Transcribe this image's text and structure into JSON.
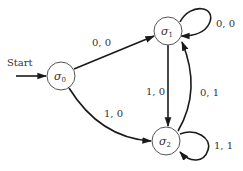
{
  "diagram": {
    "type": "finite-state-machine",
    "start_label": "Start",
    "states": [
      {
        "id": "s0",
        "symbol": "σ",
        "subscript": "0"
      },
      {
        "id": "s1",
        "symbol": "σ",
        "subscript": "1"
      },
      {
        "id": "s2",
        "symbol": "σ",
        "subscript": "2"
      }
    ],
    "start_state": "s0",
    "transitions": [
      {
        "from": "s0",
        "to": "s1",
        "label": "0, 0"
      },
      {
        "from": "s0",
        "to": "s2",
        "label": "1, 0"
      },
      {
        "from": "s1",
        "to": "s1",
        "label": "0, 0"
      },
      {
        "from": "s1",
        "to": "s2",
        "label": "1, 0"
      },
      {
        "from": "s2",
        "to": "s1",
        "label": "0, 1"
      },
      {
        "from": "s2",
        "to": "s2",
        "label": "1, 1"
      }
    ]
  }
}
